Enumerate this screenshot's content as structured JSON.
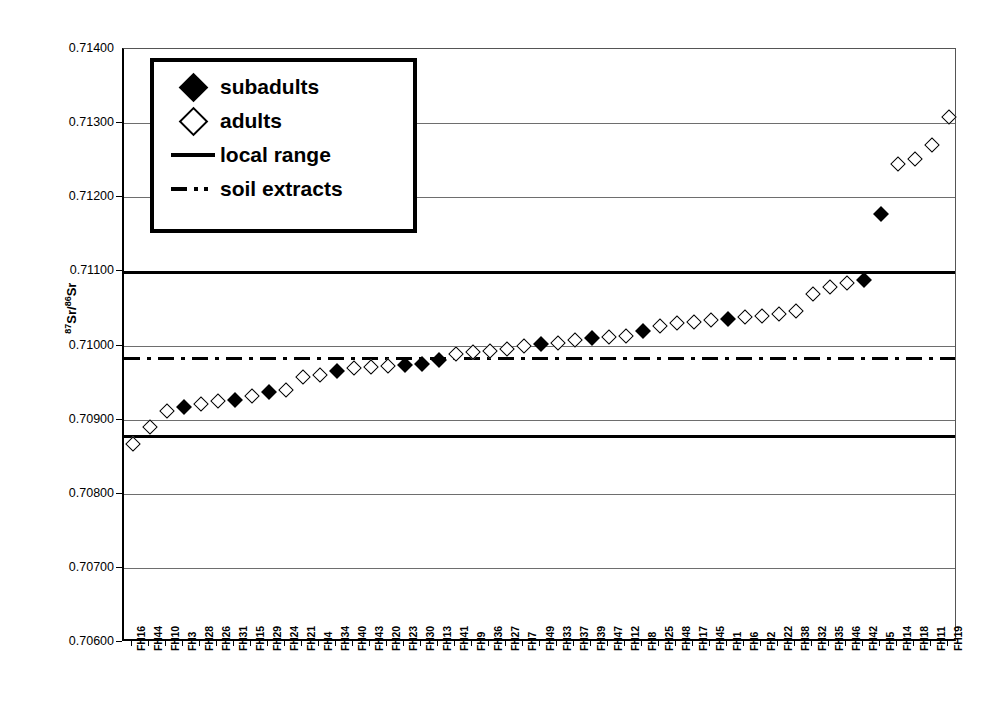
{
  "chart_data": {
    "type": "scatter",
    "title": "",
    "xlabel": "",
    "ylabel": "87Sr/86Sr",
    "ylabel_parts": {
      "sup1": "87",
      "mid": "Sr/",
      "sup2": "86",
      "end": "Sr"
    },
    "ylim": [
      0.706,
      0.714
    ],
    "ytick_labels": [
      "0.71400",
      "0.71300",
      "0.71200",
      "0.71100",
      "0.71000",
      "0.70900",
      "0.70800",
      "0.70700",
      "0.70600"
    ],
    "ytick_values": [
      0.714,
      0.713,
      0.712,
      0.711,
      0.71,
      0.709,
      0.708,
      0.707,
      0.706
    ],
    "grid": true,
    "legend_position": "top-left",
    "categories": [
      "FH16",
      "FH44",
      "FH10",
      "FH3",
      "FH28",
      "FH26",
      "FH31",
      "FH15",
      "FH29",
      "FH24",
      "FH21",
      "FH4",
      "FH34",
      "FH40",
      "FH43",
      "FH20",
      "FH23",
      "FH30",
      "FH13",
      "FH41",
      "FH9",
      "FH36",
      "FH27",
      "FH7",
      "FH49",
      "FH33",
      "FH37",
      "FH39",
      "FH47",
      "FH12",
      "FH8",
      "FH25",
      "FH48",
      "FH17",
      "FH45",
      "FH1",
      "FH6",
      "FH2",
      "FH22",
      "FH38",
      "FH32",
      "FH35",
      "FH46",
      "FH42",
      "FH5",
      "FH14",
      "FH18",
      "FH11",
      "FH19"
    ],
    "values": [
      0.70867,
      0.7089,
      0.70912,
      0.70917,
      0.70921,
      0.70925,
      0.70927,
      0.70932,
      0.70937,
      0.7094,
      0.70957,
      0.7096,
      0.70966,
      0.70969,
      0.70971,
      0.70972,
      0.70974,
      0.70975,
      0.7098,
      0.70988,
      0.70991,
      0.70993,
      0.70995,
      0.71,
      0.71002,
      0.71004,
      0.71007,
      0.7101,
      0.71011,
      0.71013,
      0.7102,
      0.71026,
      0.7103,
      0.71032,
      0.71034,
      0.71036,
      0.71038,
      0.7104,
      0.71043,
      0.71047,
      0.7107,
      0.71079,
      0.71084,
      0.71088,
      0.71178,
      0.71245,
      0.71251,
      0.71271,
      0.71308
    ],
    "groups": [
      "adults",
      "adults",
      "adults",
      "subadults",
      "adults",
      "adults",
      "subadults",
      "adults",
      "subadults",
      "adults",
      "adults",
      "adults",
      "subadults",
      "adults",
      "adults",
      "adults",
      "subadults",
      "subadults",
      "subadults",
      "adults",
      "adults",
      "adults",
      "adults",
      "adults",
      "subadults",
      "adults",
      "adults",
      "subadults",
      "adults",
      "adults",
      "subadults",
      "adults",
      "adults",
      "adults",
      "adults",
      "subadults",
      "adults",
      "adults",
      "adults",
      "adults",
      "adults",
      "adults",
      "adults",
      "subadults",
      "subadults",
      "adults",
      "adults",
      "adults",
      "adults"
    ],
    "series": [
      {
        "name": "subadults",
        "marker": "filled-diamond"
      },
      {
        "name": "adults",
        "marker": "open-diamond"
      }
    ],
    "reference_lines": [
      {
        "name": "local range",
        "style": "solid",
        "value": 0.71098
      },
      {
        "name": "local range",
        "style": "solid",
        "value": 0.70877
      },
      {
        "name": "soil extracts",
        "style": "dash-dot",
        "value": 0.70983
      }
    ]
  },
  "legend": {
    "entries": [
      {
        "label": "subadults",
        "key": "filled-diamond"
      },
      {
        "label": "adults",
        "key": "open-diamond"
      },
      {
        "label": "local  range",
        "key": "solid-line"
      },
      {
        "label": "soil extracts",
        "key": "dash-dot-line"
      }
    ]
  }
}
